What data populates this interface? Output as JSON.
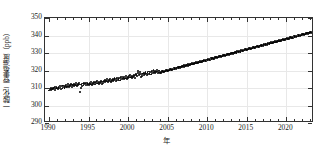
{
  "chart_data": {
    "type": "scatter",
    "title": "",
    "xlabel": "年",
    "ylabel": "一酸化二窒素濃度（ppb）",
    "yunit": "ppb",
    "xlim": [
      1989.5,
      2023.5
    ],
    "ylim": [
      290,
      350
    ],
    "grid": true,
    "legend": null,
    "xticks": [
      1990,
      1995,
      2000,
      2005,
      2010,
      2015,
      2020
    ],
    "yticks": [
      290,
      300,
      310,
      320,
      330,
      340,
      350
    ],
    "xtick_labels": [
      "1990",
      "1995",
      "2000",
      "2005",
      "2010",
      "2015",
      "2020"
    ],
    "ytick_labels": [
      "290",
      "300",
      "310",
      "320",
      "330",
      "340",
      "350"
    ],
    "minor_xtick_interval": 1,
    "series_name": "一酸化二窒素濃度",
    "marker": "filled-circle",
    "marker_color": "#000000",
    "x": [
      1990.04,
      1990.12,
      1990.21,
      1990.29,
      1990.37,
      1990.46,
      1990.54,
      1990.62,
      1990.71,
      1990.79,
      1990.87,
      1990.96,
      1991.04,
      1991.12,
      1991.21,
      1991.29,
      1991.37,
      1991.46,
      1991.54,
      1991.62,
      1991.71,
      1991.79,
      1991.87,
      1991.96,
      1992.04,
      1992.12,
      1992.21,
      1992.29,
      1992.37,
      1992.46,
      1992.54,
      1992.62,
      1992.71,
      1992.79,
      1992.87,
      1992.96,
      1993.04,
      1993.12,
      1993.21,
      1993.29,
      1993.37,
      1993.46,
      1993.54,
      1993.62,
      1993.71,
      1993.79,
      1993.87,
      1993.96,
      1994.04,
      1994.12,
      1994.21,
      1994.29,
      1994.37,
      1994.46,
      1994.54,
      1994.62,
      1994.71,
      1994.79,
      1994.87,
      1994.96,
      1995.04,
      1995.12,
      1995.21,
      1995.29,
      1995.37,
      1995.46,
      1995.54,
      1995.62,
      1995.71,
      1995.79,
      1995.87,
      1995.96,
      1996.04,
      1996.12,
      1996.21,
      1996.29,
      1996.37,
      1996.46,
      1996.54,
      1996.62,
      1996.71,
      1996.79,
      1996.87,
      1996.96,
      1997.04,
      1997.12,
      1997.21,
      1997.29,
      1997.37,
      1997.46,
      1997.54,
      1997.62,
      1997.71,
      1997.79,
      1997.87,
      1997.96,
      1998.04,
      1998.12,
      1998.21,
      1998.29,
      1998.37,
      1998.46,
      1998.54,
      1998.62,
      1998.71,
      1998.79,
      1998.87,
      1998.96,
      1999.04,
      1999.12,
      1999.21,
      1999.29,
      1999.37,
      1999.46,
      1999.54,
      1999.62,
      1999.71,
      1999.79,
      1999.87,
      1999.96,
      2000.04,
      2000.12,
      2000.21,
      2000.29,
      2000.37,
      2000.46,
      2000.54,
      2000.62,
      2000.71,
      2000.79,
      2000.87,
      2000.96,
      2001.04,
      2001.12,
      2001.21,
      2001.29,
      2001.37,
      2001.46,
      2001.54,
      2001.62,
      2001.71,
      2001.79,
      2001.87,
      2001.96,
      2002.04,
      2002.12,
      2002.21,
      2002.29,
      2002.37,
      2002.46,
      2002.54,
      2002.62,
      2002.71,
      2002.79,
      2002.87,
      2002.96,
      2003.04,
      2003.12,
      2003.21,
      2003.29,
      2003.37,
      2003.46,
      2003.54,
      2003.62,
      2003.71,
      2003.79,
      2003.87,
      2003.96,
      2004.04,
      2004.12,
      2004.21,
      2004.29,
      2004.37,
      2004.46,
      2004.54,
      2004.62,
      2004.71,
      2004.79,
      2004.87,
      2004.96,
      2005.04,
      2005.12,
      2005.21,
      2005.29,
      2005.37,
      2005.46,
      2005.54,
      2005.62,
      2005.71,
      2005.79,
      2005.87,
      2005.96,
      2006.04,
      2006.12,
      2006.21,
      2006.29,
      2006.37,
      2006.46,
      2006.54,
      2006.62,
      2006.71,
      2006.79,
      2006.87,
      2006.96,
      2007.04,
      2007.12,
      2007.21,
      2007.29,
      2007.37,
      2007.46,
      2007.54,
      2007.62,
      2007.71,
      2007.79,
      2007.87,
      2007.96,
      2008.04,
      2008.12,
      2008.21,
      2008.29,
      2008.37,
      2008.46,
      2008.54,
      2008.62,
      2008.71,
      2008.79,
      2008.87,
      2008.96,
      2009.04,
      2009.12,
      2009.21,
      2009.29,
      2009.37,
      2009.46,
      2009.54,
      2009.62,
      2009.71,
      2009.79,
      2009.87,
      2009.96,
      2010.04,
      2010.12,
      2010.21,
      2010.29,
      2010.37,
      2010.46,
      2010.54,
      2010.62,
      2010.71,
      2010.79,
      2010.87,
      2010.96,
      2011.04,
      2011.12,
      2011.21,
      2011.29,
      2011.37,
      2011.46,
      2011.54,
      2011.62,
      2011.71,
      2011.79,
      2011.87,
      2011.96,
      2012.04,
      2012.12,
      2012.21,
      2012.29,
      2012.37,
      2012.46,
      2012.54,
      2012.62,
      2012.71,
      2012.79,
      2012.87,
      2012.96,
      2013.04,
      2013.12,
      2013.21,
      2013.29,
      2013.37,
      2013.46,
      2013.54,
      2013.62,
      2013.71,
      2013.79,
      2013.87,
      2013.96,
      2014.04,
      2014.12,
      2014.21,
      2014.29,
      2014.37,
      2014.46,
      2014.54,
      2014.62,
      2014.71,
      2014.79,
      2014.87,
      2014.96,
      2015.04,
      2015.12,
      2015.21,
      2015.29,
      2015.37,
      2015.46,
      2015.54,
      2015.62,
      2015.71,
      2015.79,
      2015.87,
      2015.96,
      2016.04,
      2016.12,
      2016.21,
      2016.29,
      2016.37,
      2016.46,
      2016.54,
      2016.62,
      2016.71,
      2016.79,
      2016.87,
      2016.96,
      2017.04,
      2017.12,
      2017.21,
      2017.29,
      2017.37,
      2017.46,
      2017.54,
      2017.62,
      2017.71,
      2017.79,
      2017.87,
      2017.96,
      2018.04,
      2018.12,
      2018.21,
      2018.29,
      2018.37,
      2018.46,
      2018.54,
      2018.62,
      2018.71,
      2018.79,
      2018.87,
      2018.96,
      2019.04,
      2019.12,
      2019.21,
      2019.29,
      2019.37,
      2019.46,
      2019.54,
      2019.62,
      2019.71,
      2019.79,
      2019.87,
      2019.96,
      2020.04,
      2020.12,
      2020.21,
      2020.29,
      2020.37,
      2020.46,
      2020.54,
      2020.62,
      2020.71,
      2020.79,
      2020.87,
      2020.96,
      2021.04,
      2021.12,
      2021.21,
      2021.29,
      2021.37,
      2021.46,
      2021.54,
      2021.62,
      2021.71,
      2021.79,
      2021.87,
      2021.96,
      2022.04,
      2022.12,
      2022.21,
      2022.29,
      2022.37,
      2022.46,
      2022.54,
      2022.62,
      2022.71,
      2022.79,
      2022.87,
      2022.96,
      2023.04,
      2023.12,
      2023.21
    ],
    "y": [
      308.6,
      309.3,
      308.8,
      310.1,
      309.4,
      310.0,
      309.2,
      309.9,
      309.1,
      310.4,
      309.7,
      310.6,
      310.2,
      309.5,
      310.8,
      309.9,
      311.1,
      310.3,
      309.6,
      310.9,
      310.1,
      311.4,
      310.5,
      309.8,
      311.0,
      310.4,
      311.7,
      310.8,
      312.1,
      311.2,
      310.5,
      311.8,
      311.0,
      312.3,
      311.5,
      310.7,
      311.9,
      311.2,
      312.4,
      311.5,
      312.8,
      311.9,
      311.1,
      312.5,
      311.6,
      312.9,
      312.0,
      307.5,
      310.2,
      312.1,
      311.3,
      312.6,
      311.8,
      313.0,
      312.2,
      311.4,
      312.7,
      311.9,
      313.1,
      312.3,
      311.6,
      312.9,
      312.1,
      313.4,
      312.5,
      311.8,
      313.1,
      312.3,
      313.6,
      312.8,
      312.0,
      313.3,
      312.6,
      313.9,
      313.0,
      312.2,
      313.5,
      312.7,
      314.0,
      313.2,
      312.4,
      313.7,
      312.9,
      314.2,
      313.4,
      314.6,
      313.8,
      315.0,
      314.1,
      313.3,
      314.7,
      313.9,
      315.1,
      314.2,
      313.5,
      314.8,
      314.0,
      315.3,
      314.5,
      315.8,
      314.9,
      314.1,
      315.5,
      314.6,
      315.9,
      315.1,
      314.3,
      315.7,
      314.8,
      316.1,
      315.3,
      316.6,
      315.7,
      314.9,
      316.3,
      315.4,
      316.7,
      315.9,
      315.1,
      316.5,
      315.6,
      316.9,
      316.0,
      317.4,
      316.5,
      315.7,
      317.1,
      316.2,
      317.5,
      316.7,
      315.9,
      317.3,
      318.0,
      317.1,
      319.6,
      318.4,
      317.5,
      319.0,
      318.1,
      316.4,
      317.8,
      316.9,
      318.3,
      317.4,
      318.7,
      317.8,
      319.2,
      318.3,
      317.5,
      318.9,
      318.0,
      319.4,
      318.5,
      317.7,
      319.1,
      318.2,
      319.6,
      318.7,
      320.1,
      319.2,
      318.4,
      319.8,
      318.9,
      320.3,
      319.4,
      318.6,
      320.0,
      319.1,
      318.5,
      319.2,
      318.8,
      319.5,
      319.0,
      319.7,
      319.2,
      319.9,
      319.4,
      320.1,
      319.6,
      320.3,
      319.8,
      320.5,
      320.0,
      320.7,
      320.2,
      320.9,
      320.4,
      321.1,
      320.6,
      321.3,
      320.8,
      321.5,
      321.0,
      321.7,
      321.2,
      321.9,
      321.4,
      322.1,
      321.6,
      322.3,
      321.8,
      322.5,
      322.0,
      322.7,
      322.2,
      322.9,
      322.4,
      323.1,
      322.6,
      323.3,
      322.8,
      323.5,
      323.0,
      323.7,
      323.2,
      323.9,
      323.4,
      324.1,
      323.6,
      324.3,
      323.8,
      324.5,
      324.0,
      324.7,
      324.2,
      324.9,
      324.4,
      325.1,
      324.6,
      325.3,
      324.8,
      325.5,
      325.0,
      325.7,
      325.2,
      325.9,
      325.4,
      326.1,
      325.6,
      326.3,
      325.8,
      326.5,
      326.0,
      326.7,
      326.2,
      326.9,
      326.4,
      327.1,
      326.6,
      327.3,
      326.8,
      327.5,
      327.0,
      327.7,
      327.2,
      327.9,
      327.4,
      328.1,
      327.6,
      328.3,
      327.8,
      328.5,
      328.0,
      328.7,
      328.2,
      328.9,
      328.4,
      329.1,
      328.6,
      329.3,
      328.8,
      329.5,
      329.0,
      329.7,
      329.2,
      329.9,
      329.4,
      330.1,
      329.6,
      330.3,
      329.8,
      330.5,
      330.0,
      330.7,
      330.2,
      330.9,
      330.4,
      331.1,
      330.6,
      331.3,
      330.8,
      331.5,
      331.0,
      331.7,
      331.2,
      331.9,
      331.4,
      332.1,
      331.6,
      332.3,
      331.8,
      332.5,
      332.0,
      332.7,
      332.2,
      332.9,
      332.4,
      333.1,
      332.6,
      333.3,
      332.8,
      333.5,
      333.0,
      333.7,
      333.2,
      333.9,
      333.4,
      334.1,
      333.6,
      334.3,
      333.8,
      334.5,
      334.0,
      334.7,
      334.2,
      334.9,
      334.4,
      335.1,
      334.6,
      335.3,
      334.8,
      335.5,
      335.0,
      335.7,
      335.2,
      335.9,
      335.4,
      336.1,
      335.6,
      336.3,
      335.8,
      336.5,
      336.0,
      336.7,
      336.2,
      336.9,
      336.4,
      337.1,
      336.6,
      337.3,
      336.8,
      337.5,
      337.0,
      337.7,
      337.2,
      337.9,
      337.4,
      338.1,
      337.6,
      338.3,
      337.8,
      338.5,
      338.0,
      338.7,
      338.2,
      338.9,
      338.4,
      339.1,
      338.6,
      339.3,
      338.8,
      339.5,
      339.0,
      339.7,
      339.2,
      339.9,
      339.4,
      340.1,
      339.6,
      340.3,
      339.8,
      340.5,
      340.0,
      340.7,
      340.2,
      340.9,
      340.4,
      341.1,
      340.6,
      341.3,
      340.8,
      341.5,
      341.0,
      341.7,
      341.2,
      341.9,
      341.4,
      342.1,
      341.6
    ]
  }
}
